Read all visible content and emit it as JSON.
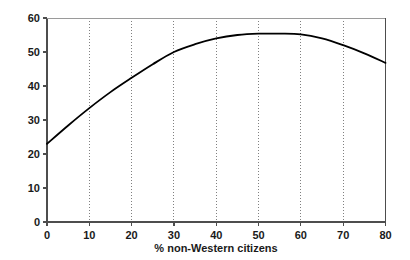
{
  "chart_data": {
    "type": "line",
    "title": "",
    "subtitle": "",
    "xlabel": "% non-Western citizens",
    "ylabel": "",
    "xlim": [
      0,
      80
    ],
    "ylim": [
      0,
      60
    ],
    "xticks": [
      0,
      10,
      20,
      30,
      40,
      50,
      60,
      70,
      80
    ],
    "yticks": [
      0,
      10,
      20,
      30,
      40,
      50,
      60
    ],
    "xtick_labels": [
      "0",
      "10",
      "20",
      "30",
      "40",
      "50",
      "60",
      "70",
      "80"
    ],
    "ytick_labels": [
      "0",
      "10",
      "20",
      "30",
      "40",
      "50",
      "60"
    ],
    "grid": {
      "vertical": true,
      "horizontal": false,
      "style": "dotted",
      "color": "#808080",
      "at_x": [
        10,
        20,
        30,
        40,
        50,
        60,
        70
      ]
    },
    "legend": null,
    "annotations": [],
    "series": [
      {
        "name": "fitted curve",
        "color": "#000000",
        "line_width": 1.8,
        "x": [
          0,
          5,
          10,
          15,
          20,
          25,
          30,
          35,
          40,
          45,
          50,
          55,
          60,
          65,
          70,
          75,
          80
        ],
        "y": [
          23.0,
          28.4,
          33.5,
          38.2,
          42.4,
          46.4,
          50.0,
          52.3,
          54.0,
          55.0,
          55.4,
          55.4,
          55.2,
          54.0,
          52.0,
          49.6,
          46.8
        ]
      }
    ]
  },
  "figure": {
    "background_color": "#ffffff",
    "axis_color": "#4d4d4d",
    "text_color": "#1a1a1a"
  }
}
